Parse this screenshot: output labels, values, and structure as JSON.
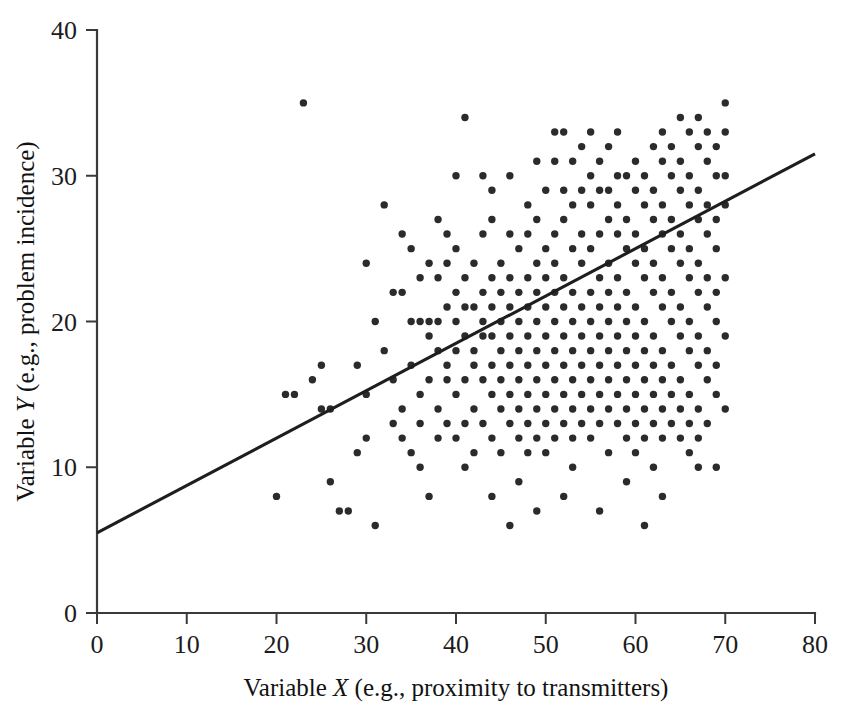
{
  "chart_data": {
    "type": "scatter",
    "title": "",
    "subtitle": "",
    "xlabel_parts": {
      "pre": "Variable ",
      "variable": "X",
      "post": " (e.g., proximity to transmitters)"
    },
    "ylabel_parts": {
      "pre": "Variable ",
      "variable": "Y",
      "post": " (e.g., problem incidence)"
    },
    "xlabel": "Variable X (e.g., proximity to transmitters)",
    "ylabel": "Variable Y (e.g., problem incidence)",
    "xlim": [
      0,
      80
    ],
    "ylim": [
      0,
      40
    ],
    "xticks": [
      0,
      10,
      20,
      30,
      40,
      50,
      60,
      70,
      80
    ],
    "yticks": [
      0,
      10,
      20,
      30,
      40
    ],
    "grid": false,
    "legend": null,
    "legend_position": "none",
    "marker": {
      "shape": "circle",
      "size_px": 7.4,
      "color": "#2b2b2b"
    },
    "trend_line": {
      "label": "regression line",
      "color": "#1e1e1e",
      "width_px": 3.1,
      "x_start": 0,
      "y_start": 5.5,
      "x_end": 80,
      "y_end": 31.5,
      "slope": 0.325,
      "intercept": 5.5
    },
    "n_points": 318,
    "points": [
      [
        20,
        8
      ],
      [
        21,
        15
      ],
      [
        22,
        15
      ],
      [
        23,
        35
      ],
      [
        24,
        16
      ],
      [
        25,
        17
      ],
      [
        26,
        9
      ],
      [
        26,
        14
      ],
      [
        27,
        7
      ],
      [
        28,
        7
      ],
      [
        29,
        11
      ],
      [
        30,
        15
      ],
      [
        30,
        12
      ],
      [
        30,
        24
      ],
      [
        31,
        6
      ],
      [
        31,
        20
      ],
      [
        32,
        18
      ],
      [
        32,
        28
      ],
      [
        33,
        13
      ],
      [
        33,
        16
      ],
      [
        34,
        12
      ],
      [
        34,
        14
      ],
      [
        34,
        22
      ],
      [
        34,
        26
      ],
      [
        35,
        11
      ],
      [
        35,
        17
      ],
      [
        35,
        20
      ],
      [
        35,
        25
      ],
      [
        36,
        13
      ],
      [
        36,
        15
      ],
      [
        36,
        20
      ],
      [
        36,
        23
      ],
      [
        37,
        8
      ],
      [
        37,
        16
      ],
      [
        37,
        19
      ],
      [
        37,
        20
      ],
      [
        37,
        24
      ],
      [
        38,
        12
      ],
      [
        38,
        14
      ],
      [
        38,
        18
      ],
      [
        38,
        20
      ],
      [
        38,
        23
      ],
      [
        39,
        13
      ],
      [
        39,
        16
      ],
      [
        39,
        17
      ],
      [
        39,
        21
      ],
      [
        39,
        24
      ],
      [
        39,
        26
      ],
      [
        40,
        12
      ],
      [
        40,
        15
      ],
      [
        40,
        18
      ],
      [
        40,
        20
      ],
      [
        40,
        22
      ],
      [
        40,
        25
      ],
      [
        40,
        30
      ],
      [
        41,
        13
      ],
      [
        41,
        16
      ],
      [
        41,
        19
      ],
      [
        41,
        21
      ],
      [
        41,
        23
      ],
      [
        41,
        34
      ],
      [
        42,
        11
      ],
      [
        42,
        14
      ],
      [
        42,
        17
      ],
      [
        42,
        18
      ],
      [
        42,
        21
      ],
      [
        42,
        24
      ],
      [
        43,
        13
      ],
      [
        43,
        16
      ],
      [
        43,
        19
      ],
      [
        43,
        20
      ],
      [
        43,
        22
      ],
      [
        43,
        26
      ],
      [
        44,
        12
      ],
      [
        44,
        15
      ],
      [
        44,
        17
      ],
      [
        44,
        19
      ],
      [
        44,
        21
      ],
      [
        44,
        23
      ],
      [
        44,
        27
      ],
      [
        45,
        11
      ],
      [
        45,
        14
      ],
      [
        45,
        16
      ],
      [
        45,
        18
      ],
      [
        45,
        20
      ],
      [
        45,
        22
      ],
      [
        45,
        24
      ],
      [
        46,
        6
      ],
      [
        46,
        13
      ],
      [
        46,
        15
      ],
      [
        46,
        17
      ],
      [
        46,
        19
      ],
      [
        46,
        21
      ],
      [
        46,
        23
      ],
      [
        46,
        26
      ],
      [
        46,
        30
      ],
      [
        47,
        12
      ],
      [
        47,
        14
      ],
      [
        47,
        16
      ],
      [
        47,
        18
      ],
      [
        47,
        20
      ],
      [
        47,
        22
      ],
      [
        47,
        25
      ],
      [
        48,
        13
      ],
      [
        48,
        15
      ],
      [
        48,
        17
      ],
      [
        48,
        19
      ],
      [
        48,
        21
      ],
      [
        48,
        23
      ],
      [
        48,
        26
      ],
      [
        48,
        28
      ],
      [
        49,
        12
      ],
      [
        49,
        14
      ],
      [
        49,
        16
      ],
      [
        49,
        18
      ],
      [
        49,
        20
      ],
      [
        49,
        22
      ],
      [
        49,
        24
      ],
      [
        49,
        27
      ],
      [
        49,
        31
      ],
      [
        50,
        11
      ],
      [
        50,
        13
      ],
      [
        50,
        15
      ],
      [
        50,
        17
      ],
      [
        50,
        19
      ],
      [
        50,
        21
      ],
      [
        50,
        23
      ],
      [
        50,
        25
      ],
      [
        50,
        29
      ],
      [
        51,
        12
      ],
      [
        51,
        14
      ],
      [
        51,
        16
      ],
      [
        51,
        18
      ],
      [
        51,
        20
      ],
      [
        51,
        22
      ],
      [
        51,
        24
      ],
      [
        51,
        26
      ],
      [
        51,
        31
      ],
      [
        52,
        13
      ],
      [
        52,
        15
      ],
      [
        52,
        17
      ],
      [
        52,
        19
      ],
      [
        52,
        21
      ],
      [
        52,
        23
      ],
      [
        52,
        27
      ],
      [
        52,
        29
      ],
      [
        52,
        33
      ],
      [
        53,
        12
      ],
      [
        53,
        14
      ],
      [
        53,
        16
      ],
      [
        53,
        18
      ],
      [
        53,
        20
      ],
      [
        53,
        22
      ],
      [
        53,
        25
      ],
      [
        53,
        28
      ],
      [
        53,
        31
      ],
      [
        54,
        13
      ],
      [
        54,
        15
      ],
      [
        54,
        17
      ],
      [
        54,
        19
      ],
      [
        54,
        21
      ],
      [
        54,
        24
      ],
      [
        54,
        26
      ],
      [
        54,
        29
      ],
      [
        54,
        32
      ],
      [
        55,
        12
      ],
      [
        55,
        14
      ],
      [
        55,
        16
      ],
      [
        55,
        18
      ],
      [
        55,
        20
      ],
      [
        55,
        22
      ],
      [
        55,
        25
      ],
      [
        55,
        28
      ],
      [
        55,
        30
      ],
      [
        55,
        33
      ],
      [
        56,
        13
      ],
      [
        56,
        15
      ],
      [
        56,
        17
      ],
      [
        56,
        19
      ],
      [
        56,
        21
      ],
      [
        56,
        23
      ],
      [
        56,
        26
      ],
      [
        56,
        29
      ],
      [
        56,
        31
      ],
      [
        57,
        14
      ],
      [
        57,
        16
      ],
      [
        57,
        18
      ],
      [
        57,
        20
      ],
      [
        57,
        22
      ],
      [
        57,
        24
      ],
      [
        57,
        27
      ],
      [
        57,
        29
      ],
      [
        57,
        32
      ],
      [
        58,
        13
      ],
      [
        58,
        15
      ],
      [
        58,
        17
      ],
      [
        58,
        19
      ],
      [
        58,
        21
      ],
      [
        58,
        23
      ],
      [
        58,
        26
      ],
      [
        58,
        28
      ],
      [
        58,
        30
      ],
      [
        59,
        12
      ],
      [
        59,
        14
      ],
      [
        59,
        16
      ],
      [
        59,
        18
      ],
      [
        59,
        20
      ],
      [
        59,
        22
      ],
      [
        59,
        25
      ],
      [
        59,
        27
      ],
      [
        59,
        30
      ],
      [
        60,
        11
      ],
      [
        60,
        13
      ],
      [
        60,
        15
      ],
      [
        60,
        17
      ],
      [
        60,
        19
      ],
      [
        60,
        21
      ],
      [
        60,
        24
      ],
      [
        60,
        26
      ],
      [
        60,
        29
      ],
      [
        60,
        31
      ],
      [
        61,
        6
      ],
      [
        61,
        12
      ],
      [
        61,
        14
      ],
      [
        61,
        16
      ],
      [
        61,
        18
      ],
      [
        61,
        20
      ],
      [
        61,
        23
      ],
      [
        61,
        25
      ],
      [
        61,
        28
      ],
      [
        61,
        30
      ],
      [
        62,
        13
      ],
      [
        62,
        15
      ],
      [
        62,
        17
      ],
      [
        62,
        19
      ],
      [
        62,
        22
      ],
      [
        62,
        24
      ],
      [
        62,
        27
      ],
      [
        62,
        29
      ],
      [
        62,
        32
      ],
      [
        63,
        12
      ],
      [
        63,
        14
      ],
      [
        63,
        16
      ],
      [
        63,
        18
      ],
      [
        63,
        21
      ],
      [
        63,
        23
      ],
      [
        63,
        26
      ],
      [
        63,
        28
      ],
      [
        63,
        31
      ],
      [
        63,
        33
      ],
      [
        64,
        13
      ],
      [
        64,
        15
      ],
      [
        64,
        17
      ],
      [
        64,
        20
      ],
      [
        64,
        22
      ],
      [
        64,
        25
      ],
      [
        64,
        27
      ],
      [
        64,
        30
      ],
      [
        64,
        32
      ],
      [
        65,
        12
      ],
      [
        65,
        14
      ],
      [
        65,
        16
      ],
      [
        65,
        19
      ],
      [
        65,
        21
      ],
      [
        65,
        24
      ],
      [
        65,
        26
      ],
      [
        65,
        29
      ],
      [
        65,
        31
      ],
      [
        65,
        34
      ],
      [
        66,
        13
      ],
      [
        66,
        15
      ],
      [
        66,
        18
      ],
      [
        66,
        20
      ],
      [
        66,
        23
      ],
      [
        66,
        25
      ],
      [
        66,
        28
      ],
      [
        66,
        30
      ],
      [
        66,
        33
      ],
      [
        67,
        12
      ],
      [
        67,
        14
      ],
      [
        67,
        17
      ],
      [
        67,
        19
      ],
      [
        67,
        22
      ],
      [
        67,
        24
      ],
      [
        67,
        27
      ],
      [
        67,
        29
      ],
      [
        67,
        32
      ],
      [
        67,
        34
      ],
      [
        68,
        13
      ],
      [
        68,
        16
      ],
      [
        68,
        18
      ],
      [
        68,
        21
      ],
      [
        68,
        23
      ],
      [
        68,
        26
      ],
      [
        68,
        28
      ],
      [
        68,
        31
      ],
      [
        68,
        33
      ],
      [
        69,
        10
      ],
      [
        69,
        15
      ],
      [
        69,
        17
      ],
      [
        69,
        20
      ],
      [
        69,
        22
      ],
      [
        69,
        25
      ],
      [
        69,
        27
      ],
      [
        69,
        30
      ],
      [
        69,
        32
      ],
      [
        70,
        14
      ],
      [
        70,
        19
      ],
      [
        70,
        23
      ],
      [
        70,
        28
      ],
      [
        70,
        30
      ],
      [
        70,
        33
      ],
      [
        70,
        35
      ],
      [
        43,
        30
      ],
      [
        51,
        33
      ],
      [
        58,
        33
      ],
      [
        44,
        29
      ],
      [
        38,
        27
      ],
      [
        33,
        22
      ],
      [
        29,
        17
      ],
      [
        25,
        14
      ],
      [
        48,
        11
      ],
      [
        53,
        10
      ],
      [
        57,
        11
      ],
      [
        62,
        10
      ],
      [
        66,
        11
      ],
      [
        67,
        10
      ],
      [
        41,
        10
      ],
      [
        36,
        10
      ],
      [
        47,
        9
      ],
      [
        44,
        8
      ],
      [
        52,
        8
      ],
      [
        59,
        9
      ],
      [
        63,
        8
      ],
      [
        49,
        7
      ],
      [
        56,
        7
      ]
    ]
  },
  "geometry": {
    "plot_left_px": 97,
    "plot_right_px": 815,
    "plot_bottom_px": 613,
    "plot_top_px": 30
  }
}
